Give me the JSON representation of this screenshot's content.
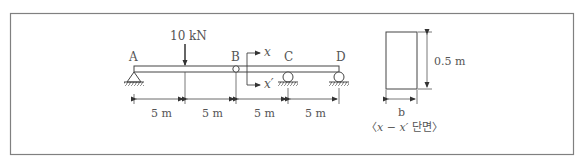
{
  "diagram": {
    "type": "structural-beam",
    "frame": {
      "border_color": "#808080"
    },
    "beam": {
      "points": [
        {
          "id": "A",
          "label": "A",
          "support": "pin"
        },
        {
          "id": "B",
          "label": "B",
          "support": "internal-hinge"
        },
        {
          "id": "C",
          "label": "C",
          "support": "roller"
        },
        {
          "id": "D",
          "label": "D",
          "support": "roller"
        }
      ],
      "load": {
        "label": "10 kN",
        "position": "5 m from A",
        "direction": "down"
      },
      "spans": [
        "5 m",
        "5 m",
        "5 m",
        "5 m"
      ],
      "section_cut": {
        "top_label": "x",
        "bottom_label": "x′"
      }
    },
    "cross_section": {
      "height_label": "0.5 m",
      "width_label": "b",
      "caption": "〈x − x′ 단면〉",
      "caption_parts": {
        "open": "〈",
        "x1": "x",
        "dash": " − ",
        "x2": "x′",
        "korean": " 단면",
        "close": "〉"
      }
    }
  }
}
